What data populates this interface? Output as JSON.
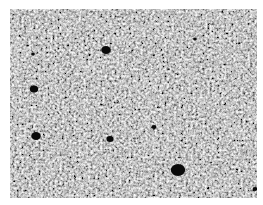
{
  "image": {
    "description": "Grayscale micrograph of fine-grained granular material with scattered dark pores",
    "background": "#ffffff",
    "tone_light": "#c8c8c8",
    "tone_dark": "#2a2a2a",
    "pores": [
      {
        "cx": 96,
        "cy": 41,
        "r": 4
      },
      {
        "cx": 24,
        "cy": 80,
        "r": 3.5
      },
      {
        "cx": 26,
        "cy": 127,
        "r": 4
      },
      {
        "cx": 100,
        "cy": 130,
        "r": 3
      },
      {
        "cx": 168,
        "cy": 161,
        "r": 6
      },
      {
        "cx": 144,
        "cy": 118,
        "r": 2
      },
      {
        "cx": 23,
        "cy": 45,
        "r": 1.5
      },
      {
        "cx": 185,
        "cy": 30,
        "r": 1.5
      },
      {
        "cx": 245,
        "cy": 180,
        "r": 2
      }
    ]
  }
}
